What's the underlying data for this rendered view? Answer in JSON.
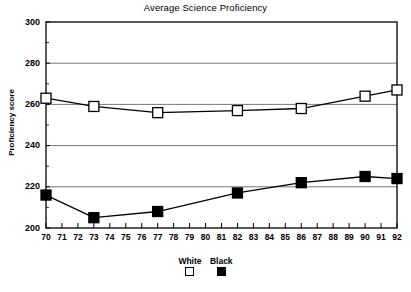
{
  "chart_data": {
    "type": "line",
    "title": "Average Science Proficiency",
    "xlabel": "",
    "ylabel": "Proficiency score",
    "x": [
      70,
      71,
      72,
      73,
      74,
      75,
      76,
      77,
      78,
      79,
      80,
      81,
      82,
      83,
      84,
      85,
      86,
      87,
      88,
      89,
      90,
      91,
      92
    ],
    "xlim": [
      70,
      92
    ],
    "ylim": [
      200,
      300
    ],
    "yticks": [
      200,
      220,
      240,
      260,
      280,
      300
    ],
    "xticks": [
      "70",
      "71",
      "72",
      "73",
      "74",
      "75",
      "76",
      "77",
      "78",
      "79",
      "80",
      "81",
      "82",
      "83",
      "84",
      "85",
      "86",
      "87",
      "88",
      "89",
      "90",
      "91",
      "92"
    ],
    "grid": true,
    "legend_position": "bottom",
    "series": [
      {
        "name": "White",
        "marker": "open-square",
        "color": "#000000",
        "fill": "#ffffff",
        "x": [
          70,
          73,
          77,
          82,
          86,
          90,
          92
        ],
        "values": [
          263,
          259,
          256,
          257,
          258,
          264,
          267
        ]
      },
      {
        "name": "Black",
        "marker": "filled-square",
        "color": "#000000",
        "fill": "#000000",
        "x": [
          70,
          73,
          77,
          82,
          86,
          90,
          92
        ],
        "values": [
          216,
          205,
          208,
          217,
          222,
          225,
          224
        ]
      }
    ]
  },
  "legend": {
    "items": [
      {
        "label": "White"
      },
      {
        "label": "Black"
      }
    ]
  },
  "axis": {
    "y_label": "Proficiency score",
    "y_ticks": [
      "300",
      "280",
      "260",
      "240",
      "220",
      "200"
    ],
    "x_ticks": [
      "70",
      "71",
      "72",
      "73",
      "74",
      "75",
      "76",
      "77",
      "78",
      "79",
      "80",
      "81",
      "82",
      "83",
      "84",
      "85",
      "86",
      "87",
      "88",
      "89",
      "90",
      "91",
      "92"
    ]
  },
  "title": "Average Science Proficiency"
}
